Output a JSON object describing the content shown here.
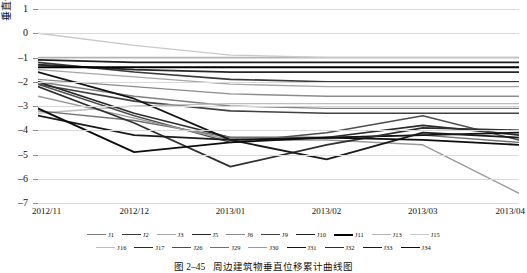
{
  "chart_data": {
    "type": "line",
    "title": "",
    "xlabel": "",
    "ylabel": "垂直位移/mm",
    "ylim": [
      -7,
      1
    ],
    "yticks": [
      1,
      0,
      -1,
      -2,
      -3,
      -4,
      -5,
      -6,
      -7
    ],
    "grid": true,
    "legend_position": "bottom",
    "x": [
      "2012/11",
      "2012/12",
      "2013/01",
      "2013/02",
      "2013/03",
      "2013/04"
    ],
    "categories": [
      "2012/11",
      "2012/12",
      "2013/01",
      "2013/02",
      "2013/03",
      "2013/04"
    ],
    "series": [
      {
        "name": "J1",
        "color": "#808080",
        "width": 1.4,
        "values": [
          -2.0,
          -2.6,
          -3.0,
          -3.1,
          -3.1,
          -3.1
        ]
      },
      {
        "name": "J2",
        "color": "#3a3a3a",
        "width": 1.6,
        "values": [
          -1.2,
          -1.6,
          -1.9,
          -2.0,
          -2.0,
          -2.0
        ]
      },
      {
        "name": "J3",
        "color": "#a6a6a6",
        "width": 1.3,
        "values": [
          -1.5,
          -1.8,
          -2.1,
          -2.2,
          -2.2,
          -2.2
        ]
      },
      {
        "name": "J5",
        "color": "#262626",
        "width": 1.8,
        "values": [
          -1.3,
          -1.5,
          -1.6,
          -1.6,
          -1.6,
          -1.6
        ]
      },
      {
        "name": "J6",
        "color": "#8c8c8c",
        "width": 1.4,
        "values": [
          -1.9,
          -2.2,
          -2.5,
          -2.6,
          -2.6,
          -2.6
        ]
      },
      {
        "name": "J9",
        "color": "#404040",
        "width": 1.6,
        "values": [
          -2.1,
          -2.8,
          -3.2,
          -3.3,
          -3.3,
          -3.3
        ]
      },
      {
        "name": "J10",
        "color": "#1f1f1f",
        "width": 1.7,
        "values": [
          -1.1,
          -1.2,
          -1.2,
          -1.2,
          -1.2,
          -1.2
        ]
      },
      {
        "name": "J11",
        "color": "#000000",
        "width": 2.0,
        "values": [
          -1.4,
          -1.4,
          -1.4,
          -1.4,
          -1.4,
          -1.4
        ]
      },
      {
        "name": "J13",
        "color": "#b3b3b3",
        "width": 1.3,
        "values": [
          -1.0,
          -1.0,
          -1.0,
          -1.0,
          -1.0,
          -1.0
        ]
      },
      {
        "name": "J15",
        "color": "#c8c8c8",
        "width": 1.3,
        "values": [
          0.0,
          -0.5,
          -0.9,
          -1.0,
          -1.0,
          -1.0
        ]
      },
      {
        "name": "J16",
        "color": "#bdbdbd",
        "width": 1.3,
        "values": [
          -3.3,
          -3.0,
          -2.9,
          -2.9,
          -2.9,
          -2.9
        ]
      },
      {
        "name": "J17",
        "color": "#2b2b2b",
        "width": 1.7,
        "values": [
          -2.0,
          -3.3,
          -4.3,
          -4.3,
          -3.8,
          -4.2
        ]
      },
      {
        "name": "J26",
        "color": "#4d4d4d",
        "width": 1.5,
        "values": [
          -2.1,
          -3.4,
          -4.5,
          -4.1,
          -3.4,
          -4.4
        ]
      },
      {
        "name": "J29",
        "color": "#707070",
        "width": 1.4,
        "values": [
          -3.2,
          -3.6,
          -4.3,
          -4.3,
          -4.2,
          -4.5
        ]
      },
      {
        "name": "J30",
        "color": "#999999",
        "width": 1.4,
        "values": [
          -2.6,
          -3.5,
          -4.4,
          -4.4,
          -4.6,
          -6.6
        ]
      },
      {
        "name": "J31",
        "color": "#141414",
        "width": 1.8,
        "values": [
          -1.6,
          -2.7,
          -4.4,
          -4.3,
          -4.2,
          -4.1
        ]
      },
      {
        "name": "J32",
        "color": "#2f2f2f",
        "width": 1.7,
        "values": [
          -2.2,
          -3.7,
          -5.5,
          -4.6,
          -3.9,
          -4.0
        ]
      },
      {
        "name": "J33",
        "color": "#1a1a1a",
        "width": 1.8,
        "values": [
          -3.4,
          -4.2,
          -4.4,
          -5.2,
          -4.1,
          -4.3
        ]
      },
      {
        "name": "J34",
        "color": "#0d0d0d",
        "width": 1.8,
        "values": [
          -3.1,
          -4.9,
          -4.5,
          -4.3,
          -4.4,
          -4.6
        ]
      }
    ]
  },
  "axis": {
    "y_title": "垂直位移/mm",
    "y_tick_labels": [
      "1",
      "0",
      "–1",
      "–2",
      "–3",
      "–4",
      "–5",
      "–6",
      "–7"
    ],
    "x_tick_labels": [
      "2012/11",
      "2012/12",
      "2013/01",
      "2013/02",
      "2013/03",
      "2013/04"
    ]
  },
  "legend": {
    "row1": [
      "J1",
      "J2",
      "J3",
      "J5",
      "J6",
      "J9",
      "J10",
      "J11",
      "J13",
      "J15"
    ],
    "row2": [
      "J16",
      "J17",
      "J26",
      "J29",
      "J30",
      "J31",
      "J32",
      "J33",
      "J34"
    ]
  },
  "caption": {
    "number": "图 2–45",
    "text": "周边建筑物垂直位移累计曲线图"
  },
  "colors": {
    "grid": "#d9d9d9",
    "axis": "#8c8c8c",
    "text": "#111111",
    "background": "#ffffff"
  }
}
